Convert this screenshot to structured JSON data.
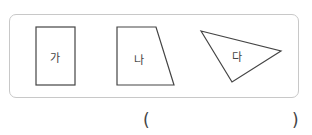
{
  "figures": [
    {
      "label": "가",
      "shape": "rectangle"
    },
    {
      "label": "나",
      "shape": "trapezoid"
    },
    {
      "label": "다",
      "shape": "triangle"
    }
  ],
  "answer": {
    "open_paren": "(",
    "close_paren": ")",
    "value": ""
  },
  "colors": {
    "stroke": "#444444",
    "panel_border": "#c8c8c8"
  }
}
